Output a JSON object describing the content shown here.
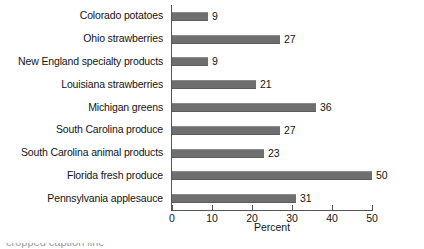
{
  "chart_data": {
    "type": "bar",
    "orientation": "horizontal",
    "title": "",
    "xlabel": "Percent",
    "ylabel": "",
    "xlim": [
      0,
      50
    ],
    "xticks": [
      0,
      10,
      20,
      30,
      40,
      50
    ],
    "grid": false,
    "legend": null,
    "bar_color": "#6f6f6f",
    "axis_color": "#555555",
    "categories": [
      "Colorado potatoes",
      "Ohio strawberries",
      "New England specialty products",
      "Louisiana strawberries",
      "Michigan greens",
      "South Carolina produce",
      "South Carolina animal products",
      "Florida fresh produce",
      "Pennsylvania applesauce"
    ],
    "values": [
      9,
      27,
      9,
      21,
      36,
      27,
      23,
      50,
      31
    ],
    "value_labels": [
      "9",
      "27",
      "9",
      "21",
      "36",
      "27",
      "23",
      "50",
      "31"
    ]
  },
  "caption": {
    "text": "cropped caption line"
  }
}
